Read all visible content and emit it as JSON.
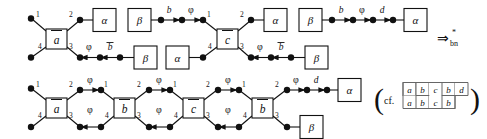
{
  "figure": {
    "type": "string-diagram-rewrite",
    "rewrite_arrow": {
      "symbol": "⇒",
      "superscript": "*",
      "subscript": "bn"
    },
    "cf_note": {
      "open_paren": "(",
      "label": "cf.",
      "close_paren": ")"
    },
    "tiling": {
      "top_row": [
        "a",
        "b",
        "c",
        "b",
        "d"
      ],
      "bottom_row": [
        "a",
        "b",
        "c",
        "b"
      ]
    },
    "symbols": {
      "alpha": "α",
      "beta": "β",
      "phi": "φ",
      "b": "b",
      "d": "d",
      "b_bar": "b",
      "a_tilde": "a",
      "b_tilde": "b",
      "c_tilde": "c"
    },
    "port_numbers": {
      "p1": "1",
      "p2": "2",
      "p3": "3",
      "p4": "4"
    },
    "top_row": {
      "gadgets": [
        {
          "name": "a-tilde",
          "label": "a",
          "ports": [
            "1",
            "2",
            "3",
            "4"
          ]
        },
        {
          "name": "c-tilde",
          "label": "c",
          "ports": [
            "1",
            "2",
            "3",
            "4"
          ]
        }
      ],
      "boxes": [
        "α",
        "β",
        "β",
        "α",
        "α",
        "β",
        "β",
        "α"
      ],
      "edge_labels_upper": [
        "b",
        "φ",
        "b",
        "φ",
        "d"
      ],
      "edge_labels_lower": [
        "φ",
        "b",
        "φ",
        "b"
      ]
    },
    "bottom_row": {
      "gadgets": [
        {
          "name": "a-tilde",
          "label": "a",
          "ports": [
            "1",
            "2",
            "3",
            "4"
          ]
        },
        {
          "name": "b-tilde",
          "label": "b",
          "ports": [
            "1",
            "2",
            "3",
            "4"
          ]
        },
        {
          "name": "c-tilde",
          "label": "c",
          "ports": [
            "1",
            "2",
            "3",
            "4"
          ]
        },
        {
          "name": "b-tilde-2",
          "label": "b",
          "ports": [
            "1",
            "2",
            "3",
            "4"
          ]
        }
      ],
      "boxes": [
        "α",
        "β"
      ],
      "edge_labels_upper": [
        "φ",
        "φ",
        "φ",
        "φ",
        "d"
      ],
      "edge_labels_lower": [
        "φ",
        "φ",
        "φ"
      ]
    }
  }
}
